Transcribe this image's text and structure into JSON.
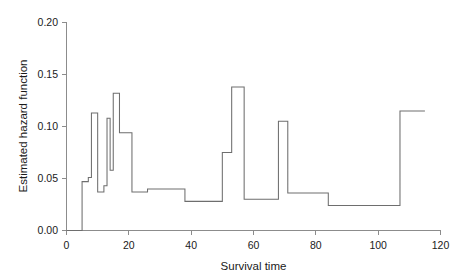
{
  "chart_data": {
    "type": "line",
    "subtype": "step-function",
    "title": "",
    "xlabel": "Survival time",
    "ylabel": "Estimated hazard function",
    "xlim": [
      0,
      120
    ],
    "ylim": [
      0.0,
      0.2
    ],
    "xticks": [
      0,
      20,
      40,
      60,
      80,
      100,
      120
    ],
    "xtick_labels": [
      "0",
      "20",
      "40",
      "60",
      "80",
      "100",
      "120"
    ],
    "yticks": [
      0.0,
      0.05,
      0.1,
      0.15,
      0.2
    ],
    "ytick_labels": [
      "0.00",
      "0.05",
      "0.10",
      "0.15",
      "0.20"
    ],
    "grid": false,
    "legend": false,
    "line_color": "#6e6e6e",
    "x": [
      0,
      5,
      7,
      8,
      10,
      11,
      13,
      14,
      15,
      16,
      17,
      18,
      21,
      26,
      38,
      50,
      51,
      55,
      60,
      63,
      68,
      72,
      84,
      107,
      115
    ],
    "values": [
      0.0,
      0.0,
      0.047,
      0.051,
      0.113,
      0.037,
      0.043,
      0.108,
      0.058,
      0.132,
      0.094,
      0.094,
      0.037,
      0.04,
      0.028,
      0.075,
      0.075,
      0.138,
      0.03,
      0.03,
      0.105,
      0.036,
      0.024,
      0.115,
      0.115
    ],
    "steps": [
      {
        "x_start": 0,
        "x_end": 5,
        "y": 0.0
      },
      {
        "x_start": 5,
        "x_end": 7,
        "y": 0.047
      },
      {
        "x_start": 7,
        "x_end": 8,
        "y": 0.051
      },
      {
        "x_start": 8,
        "x_end": 10,
        "y": 0.113
      },
      {
        "x_start": 10,
        "x_end": 12,
        "y": 0.037
      },
      {
        "x_start": 12,
        "x_end": 13,
        "y": 0.043
      },
      {
        "x_start": 13,
        "x_end": 14,
        "y": 0.108
      },
      {
        "x_start": 14,
        "x_end": 15,
        "y": 0.058
      },
      {
        "x_start": 15,
        "x_end": 17,
        "y": 0.132
      },
      {
        "x_start": 17,
        "x_end": 21,
        "y": 0.094
      },
      {
        "x_start": 21,
        "x_end": 26,
        "y": 0.037
      },
      {
        "x_start": 26,
        "x_end": 38,
        "y": 0.04
      },
      {
        "x_start": 38,
        "x_end": 50,
        "y": 0.028
      },
      {
        "x_start": 50,
        "x_end": 53,
        "y": 0.075
      },
      {
        "x_start": 53,
        "x_end": 57,
        "y": 0.138
      },
      {
        "x_start": 57,
        "x_end": 68,
        "y": 0.03
      },
      {
        "x_start": 68,
        "x_end": 71,
        "y": 0.105
      },
      {
        "x_start": 71,
        "x_end": 84,
        "y": 0.036
      },
      {
        "x_start": 84,
        "x_end": 107,
        "y": 0.024
      },
      {
        "x_start": 107,
        "x_end": 115,
        "y": 0.115
      }
    ]
  },
  "axes": {
    "y_axis_title": "Estimated hazard function",
    "x_axis_title": "Survival time",
    "y_labels": [
      "0.20",
      "0.15",
      "0.10",
      "0.05",
      "0.00"
    ],
    "x_labels": [
      "0",
      "20",
      "40",
      "60",
      "80",
      "100",
      "120"
    ]
  }
}
